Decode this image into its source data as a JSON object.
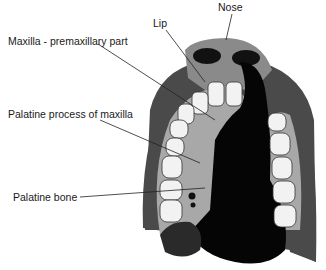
{
  "diagram": {
    "labels": [
      {
        "id": "nose",
        "text": "Nose"
      },
      {
        "id": "lip",
        "text": "Lip"
      },
      {
        "id": "maxilla",
        "text": "Maxilla - premaxillary part"
      },
      {
        "id": "palatine_process",
        "text": "Palatine process of maxilla"
      },
      {
        "id": "palatine_bone",
        "text": "Palatine bone"
      }
    ],
    "colors": {
      "outer": "#4a4a4a",
      "nose": "#8a8a8a",
      "palate": "#a8a8a8",
      "teeth": "#f2f2f2",
      "cleft": "#050505",
      "line": "#222222"
    }
  }
}
